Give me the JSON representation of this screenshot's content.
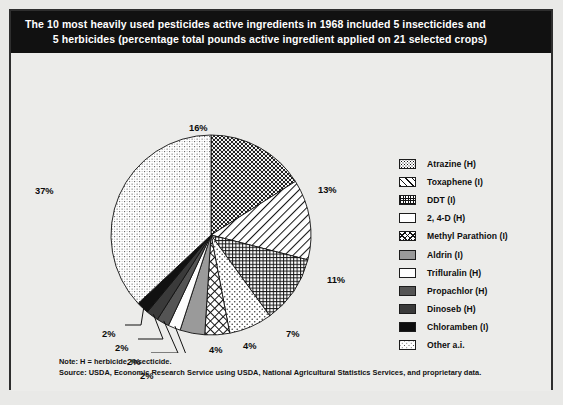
{
  "header": {
    "line1": "The 10 most heavily used pesticides active ingredients in 1968 included 5 insecticides and",
    "line2": "5 herbicides (percentage total pounds active ingredient applied on 21 selected crops)"
  },
  "legend": {
    "items": [
      {
        "label": "Atrazine (H)",
        "swatch": "checker-dot-pattern-swatch",
        "key": "atrazine"
      },
      {
        "label": "Toxaphene (I)",
        "swatch": "diagonal-line-pattern-swatch",
        "key": "toxaphene"
      },
      {
        "label": "DDT (I)",
        "swatch": "crosshatch-grid-pattern-swatch",
        "key": "ddt"
      },
      {
        "label": "2, 4-D (H)",
        "swatch": "sparse-dot-pattern-swatch",
        "key": "24d"
      },
      {
        "label": "Methyl Parathion (I)",
        "swatch": "diamond-crosshatch-pattern-swatch",
        "key": "methyl"
      },
      {
        "label": "Aldrin (I)",
        "swatch": "mid-gray-solid-swatch",
        "key": "aldrin"
      },
      {
        "label": "Trifluralin (H)",
        "swatch": "white-solid-swatch",
        "key": "trifluralin"
      },
      {
        "label": "Propachlor (H)",
        "swatch": "dark-gray-solid-swatch",
        "key": "propachlor"
      },
      {
        "label": "Dinoseb (H)",
        "swatch": "darker-gray-solid-swatch",
        "key": "dinoseb"
      },
      {
        "label": "Chloramben (I)",
        "swatch": "black-solid-swatch",
        "key": "chloramben"
      },
      {
        "label": "Other a.i.",
        "swatch": "fine-stipple-pattern-swatch",
        "key": "other"
      }
    ]
  },
  "footnote": {
    "note": "Note: H = herbicide, insecticide.",
    "source": "Source: USDA, Economic Research Service using USDA, National Agricultural Statistics Services, and proprietary data."
  },
  "chart_data": {
    "type": "pie",
    "title": "The 10 most heavily used pesticides active ingredients in 1968 included 5 insecticides and 5 herbicides (percentage total pounds active ingredient applied on 21 selected crops)",
    "xlabel": "",
    "ylabel": "",
    "unit": "percent",
    "legend_position": "right",
    "grid": false,
    "start_angle_deg": -90,
    "direction": "clockwise",
    "categories": [
      "Atrazine (H)",
      "Toxaphene (I)",
      "DDT (I)",
      "2, 4-D (H)",
      "Methyl Parathion (I)",
      "Aldrin (I)",
      "Trifluralin (H)",
      "Propachlor (H)",
      "Dinoseb (H)",
      "Chloramben (I)",
      "Other a.i."
    ],
    "values": [
      16,
      13,
      11,
      7,
      4,
      4,
      2,
      2,
      2,
      2,
      37
    ],
    "labels": [
      "16%",
      "13%",
      "11%",
      "7%",
      "4%",
      "4%",
      "2%",
      "2%",
      "2%",
      "2%",
      "37%"
    ],
    "slices": [
      {
        "name": "Atrazine (H)",
        "value": 16,
        "label": "16%",
        "pattern": "checker-dot"
      },
      {
        "name": "Toxaphene (I)",
        "value": 13,
        "label": "13%",
        "pattern": "diagonal-lines"
      },
      {
        "name": "DDT (I)",
        "value": 11,
        "label": "11%",
        "pattern": "crosshatch-grid"
      },
      {
        "name": "2, 4-D (H)",
        "value": 7,
        "label": "7%",
        "pattern": "sparse-dots"
      },
      {
        "name": "Methyl Parathion (I)",
        "value": 4,
        "label": "4%",
        "pattern": "diamond-crosshatch"
      },
      {
        "name": "Aldrin (I)",
        "value": 4,
        "label": "4%",
        "pattern": "mid-gray-solid"
      },
      {
        "name": "Trifluralin (H)",
        "value": 2,
        "label": "2%",
        "pattern": "white-solid"
      },
      {
        "name": "Propachlor (H)",
        "value": 2,
        "label": "2%",
        "pattern": "dark-gray-solid"
      },
      {
        "name": "Dinoseb (H)",
        "value": 2,
        "label": "2%",
        "pattern": "darker-gray-solid"
      },
      {
        "name": "Chloramben (I)",
        "value": 2,
        "label": "2%",
        "pattern": "black-solid"
      },
      {
        "name": "Other a.i.",
        "value": 37,
        "label": "37%",
        "pattern": "fine-stipple"
      }
    ]
  },
  "colors": {
    "page_background": "#e9e9e7",
    "panel_background": "#ececea",
    "title_bar": "#111111",
    "title_text": "#ffffff",
    "body_text": "#0d0d0d",
    "outline": "#2e2e2e"
  }
}
